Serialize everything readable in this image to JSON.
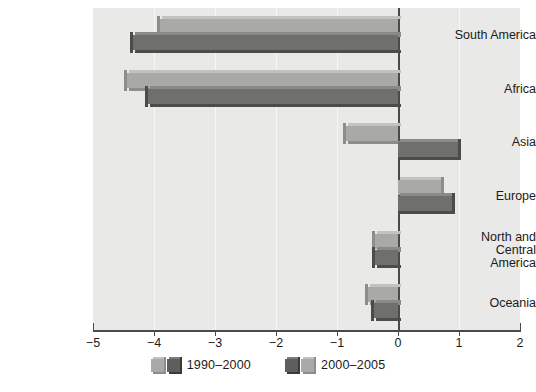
{
  "chart_data": {
    "type": "bar",
    "orientation": "horizontal",
    "title": "",
    "xlabel": "",
    "ylabel": "",
    "xlim": [
      -5,
      2
    ],
    "ylim": null,
    "grid": true,
    "legend_position": "bottom",
    "categories": [
      "South America",
      "Africa",
      "Asia",
      "Europe",
      "North and\nCentral America",
      "Oceania"
    ],
    "xticks": [
      -5,
      -4,
      -3,
      -2,
      -1,
      0,
      1,
      2
    ],
    "xtick_labels": [
      "−5",
      "−4",
      "−3",
      "−2",
      "−1",
      "0",
      "1",
      "2"
    ],
    "series": [
      {
        "name": "1990–2000",
        "color": "#a9a9a7",
        "values": [
          -3.9,
          -4.45,
          -0.85,
          0.7,
          -0.37,
          -0.5
        ]
      },
      {
        "name": "2000–2005",
        "color": "#6f6f6d",
        "values": [
          -4.35,
          -4.1,
          0.98,
          0.88,
          -0.38,
          -0.4
        ]
      }
    ]
  },
  "legend": {
    "entries": [
      {
        "label": "1990–2000"
      },
      {
        "label": "2000–2005"
      }
    ]
  },
  "colors": {
    "plot_background": "#e9e9e7",
    "page_background": "#ffffff",
    "axis": "#4a4a4a",
    "gridline": "#f7f7f5",
    "series_light": "#a9a9a7",
    "series_dark": "#6f6f6d",
    "text": "#1b1b1b"
  }
}
